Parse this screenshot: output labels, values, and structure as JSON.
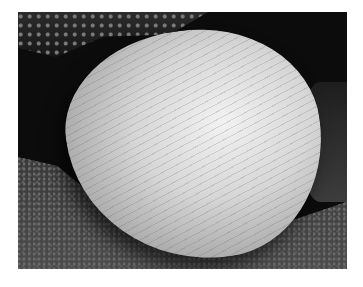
{
  "image": {
    "subject": "clam shell resting on sand",
    "tone": "grayscale photograph",
    "colors": {
      "background": "#ffffff",
      "shadow": "#0c0c0c",
      "shell_highlight": "#f2f2f2",
      "shell_midtone": "#a8a8a8",
      "sand": "#4c4c4c"
    }
  }
}
